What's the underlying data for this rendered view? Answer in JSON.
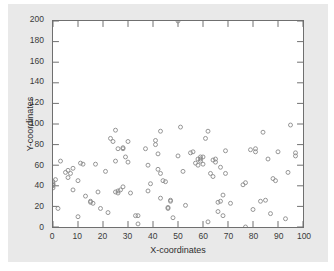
{
  "figure": {
    "background_color": "#e9e9e9",
    "plot_background_color": "#ffffff",
    "frame_color": "#6f6f6f",
    "marker_color": "#8a8a8a"
  },
  "chart_data": {
    "type": "scatter",
    "title": "",
    "xlabel": "X-coordinates",
    "ylabel": "Y-coordinates",
    "xlim": [
      0,
      100
    ],
    "ylim": [
      0,
      200
    ],
    "xticks": [
      0,
      10,
      20,
      30,
      40,
      50,
      60,
      70,
      80,
      90,
      100
    ],
    "yticks": [
      0,
      20,
      40,
      60,
      80,
      100,
      120,
      140,
      160,
      180,
      200
    ],
    "xtick_labels": [
      "0",
      "10",
      "20",
      "30",
      "40",
      "50",
      "60",
      "70",
      "80",
      "90",
      "100"
    ],
    "ytick_labels": [
      "0",
      "20",
      "40",
      "60",
      "80",
      "100",
      "120",
      "140",
      "160",
      "180",
      "200"
    ],
    "grid": false,
    "legend": null,
    "marker": "open-circle",
    "marker_size": 4,
    "series": [
      {
        "name": "coordinates",
        "points": [
          [
            0,
            44
          ],
          [
            0,
            42
          ],
          [
            0,
            41
          ],
          [
            0,
            40
          ],
          [
            0,
            38
          ],
          [
            1,
            46
          ],
          [
            2,
            18
          ],
          [
            3,
            64
          ],
          [
            5,
            53
          ],
          [
            6,
            48
          ],
          [
            6,
            55
          ],
          [
            7,
            52
          ],
          [
            8,
            36
          ],
          [
            8,
            57
          ],
          [
            10,
            10
          ],
          [
            10,
            45
          ],
          [
            11,
            62
          ],
          [
            12,
            61
          ],
          [
            13,
            30
          ],
          [
            15,
            25
          ],
          [
            15,
            24
          ],
          [
            16,
            23
          ],
          [
            17,
            61
          ],
          [
            18,
            34
          ],
          [
            19,
            18
          ],
          [
            21,
            54
          ],
          [
            22,
            14
          ],
          [
            23,
            86
          ],
          [
            24,
            83
          ],
          [
            25,
            94
          ],
          [
            25,
            64
          ],
          [
            25,
            34
          ],
          [
            26,
            76
          ],
          [
            26,
            35
          ],
          [
            26,
            33
          ],
          [
            27,
            36
          ],
          [
            28,
            77
          ],
          [
            28,
            76
          ],
          [
            28,
            39
          ],
          [
            29,
            68
          ],
          [
            30,
            83
          ],
          [
            30,
            63
          ],
          [
            31,
            33
          ],
          [
            33,
            11
          ],
          [
            34,
            11
          ],
          [
            34,
            3
          ],
          [
            37,
            76
          ],
          [
            38,
            60
          ],
          [
            38,
            35
          ],
          [
            39,
            42
          ],
          [
            41,
            80
          ],
          [
            41,
            84
          ],
          [
            42,
            71
          ],
          [
            42,
            56
          ],
          [
            43,
            93
          ],
          [
            43,
            52
          ],
          [
            43,
            28
          ],
          [
            44,
            45
          ],
          [
            45,
            44
          ],
          [
            46,
            19
          ],
          [
            46,
            18
          ],
          [
            47,
            26
          ],
          [
            47,
            25
          ],
          [
            48,
            9
          ],
          [
            50,
            200
          ],
          [
            50,
            69
          ],
          [
            51,
            97
          ],
          [
            52,
            54
          ],
          [
            53,
            21
          ],
          [
            55,
            72
          ],
          [
            56,
            73
          ],
          [
            57,
            62
          ],
          [
            58,
            66
          ],
          [
            58,
            60
          ],
          [
            59,
            68
          ],
          [
            59,
            66
          ],
          [
            59,
            64
          ],
          [
            60,
            68
          ],
          [
            60,
            61
          ],
          [
            61,
            86
          ],
          [
            62,
            5
          ],
          [
            62,
            93
          ],
          [
            63,
            52
          ],
          [
            64,
            65
          ],
          [
            64,
            49
          ],
          [
            65,
            63
          ],
          [
            65,
            66
          ],
          [
            66,
            24
          ],
          [
            66,
            15
          ],
          [
            67,
            25
          ],
          [
            67,
            58
          ],
          [
            68,
            31
          ],
          [
            68,
            11
          ],
          [
            69,
            74
          ],
          [
            69,
            52
          ],
          [
            71,
            23
          ],
          [
            76,
            41
          ],
          [
            77,
            0
          ],
          [
            77,
            43
          ],
          [
            79,
            75
          ],
          [
            80,
            17
          ],
          [
            81,
            76
          ],
          [
            81,
            73
          ],
          [
            83,
            25
          ],
          [
            84,
            92
          ],
          [
            85,
            26
          ],
          [
            86,
            66
          ],
          [
            87,
            13
          ],
          [
            88,
            47
          ],
          [
            89,
            45
          ],
          [
            90,
            73
          ],
          [
            93,
            8
          ],
          [
            94,
            53
          ],
          [
            95,
            99
          ],
          [
            97,
            72
          ],
          [
            97,
            69
          ]
        ]
      }
    ]
  }
}
